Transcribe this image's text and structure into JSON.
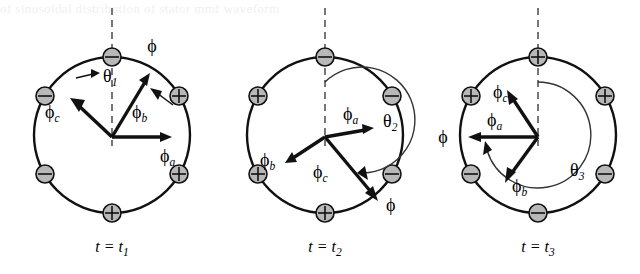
{
  "figure": {
    "title": "",
    "background_artifact_text": "of sinusoidal distribution of stator  mmf waveform",
    "panels": [
      {
        "id": "panel-1",
        "time_label": "t = t",
        "time_sub": "1",
        "angle_label": "θ",
        "angle_sub": "1",
        "rotation_label": "ϕ",
        "vectors": [
          {
            "name": "phi-a",
            "label": "ϕ",
            "sub": "a",
            "angle_deg": 0,
            "length": 58
          },
          {
            "name": "phi-b",
            "label": "ϕ",
            "sub": "b",
            "angle_deg": 115,
            "length": 70
          },
          {
            "name": "phi-c",
            "label": "ϕ",
            "sub": "c",
            "angle_deg": 150,
            "length": 55
          }
        ],
        "poles": [
          {
            "position": "top",
            "polarity": "minus"
          },
          {
            "position": "upper-right",
            "polarity": "plus"
          },
          {
            "position": "lower-right",
            "polarity": "plus"
          },
          {
            "position": "bottom",
            "polarity": "plus"
          },
          {
            "position": "lower-left",
            "polarity": "minus"
          },
          {
            "position": "upper-left",
            "polarity": "minus"
          }
        ]
      },
      {
        "id": "panel-2",
        "time_label": "t = t",
        "time_sub": "2",
        "angle_label": "θ",
        "angle_sub": "2",
        "rotation_label": "ϕ",
        "vectors": [
          {
            "name": "phi-a",
            "label": "ϕ",
            "sub": "a",
            "angle_deg": 12,
            "length": 55
          },
          {
            "name": "phi-b",
            "label": "ϕ",
            "sub": "b",
            "angle_deg": 208,
            "length": 52
          },
          {
            "name": "phi-c",
            "label": "ϕ",
            "sub": "c",
            "angle_deg": 305,
            "length": 70
          }
        ],
        "poles": [
          {
            "position": "top",
            "polarity": "minus"
          },
          {
            "position": "upper-right",
            "polarity": "minus"
          },
          {
            "position": "lower-right",
            "polarity": "minus"
          },
          {
            "position": "bottom",
            "polarity": "plus"
          },
          {
            "position": "lower-left",
            "polarity": "plus"
          },
          {
            "position": "upper-left",
            "polarity": "plus"
          }
        ]
      },
      {
        "id": "panel-3",
        "time_label": "t = t",
        "time_sub": "3",
        "angle_label": "θ",
        "angle_sub": "3",
        "rotation_label": "ϕ",
        "vectors": [
          {
            "name": "phi-a",
            "label": "ϕ",
            "sub": "a",
            "angle_deg": 180,
            "length": 72
          },
          {
            "name": "phi-b",
            "label": "ϕ",
            "sub": "b",
            "angle_deg": 243,
            "length": 52
          },
          {
            "name": "phi-c",
            "label": "ϕ",
            "sub": "c",
            "angle_deg": 114,
            "length": 55
          }
        ],
        "poles": [
          {
            "position": "top",
            "polarity": "plus"
          },
          {
            "position": "upper-right",
            "polarity": "plus"
          },
          {
            "position": "lower-right",
            "polarity": "minus"
          },
          {
            "position": "bottom",
            "polarity": "minus"
          },
          {
            "position": "lower-left",
            "polarity": "minus"
          },
          {
            "position": "upper-left",
            "polarity": "plus"
          }
        ]
      }
    ],
    "colors": {
      "stroke": "#111111",
      "pole_fill": "#b8b8b8",
      "dashed": "#555555",
      "arc": "#333333"
    }
  }
}
